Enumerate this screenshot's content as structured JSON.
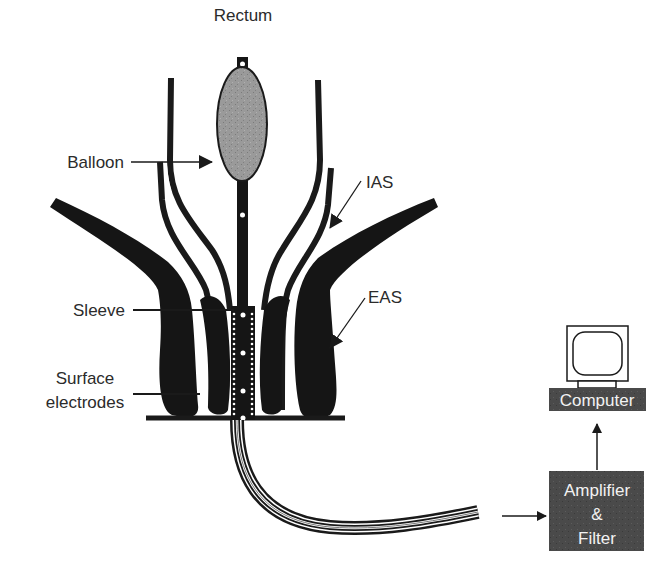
{
  "diagram": {
    "labels": {
      "rectum": "Rectum",
      "balloon": "Balloon",
      "ias": "IAS",
      "eas": "EAS",
      "sleeve": "Sleeve",
      "surface_electrodes_line1": "Surface",
      "surface_electrodes_line2": "electrodes"
    },
    "boxes": {
      "computer": "Computer",
      "amplifier_line1": "Amplifier",
      "amplifier_line2": "&",
      "amplifier_line3": "Filter"
    },
    "icons": {
      "computer": "monitor-icon"
    },
    "colors": {
      "ink": "#1a1a1a",
      "balloon_fill": "#9a9a9a",
      "box_fill": "#4a4a4a",
      "label_text": "#2b2b2b",
      "box_text": "#f2f2f2"
    },
    "flow": [
      "Catheter",
      "Amplifier & Filter",
      "Computer"
    ]
  }
}
